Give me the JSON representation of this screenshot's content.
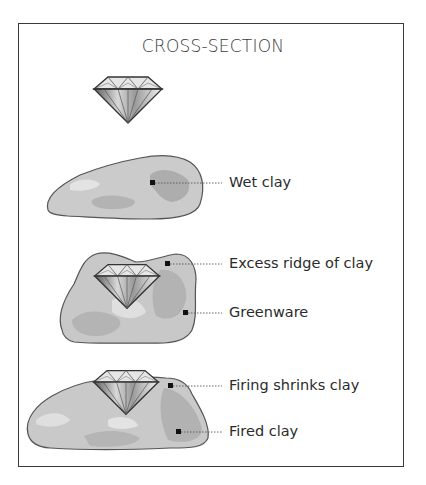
{
  "title": "CROSS-SECTION",
  "stages": [
    {
      "id": "gem",
      "description": "Loose diamond"
    },
    {
      "id": "wet",
      "labels": [
        {
          "text": "Wet clay"
        }
      ]
    },
    {
      "id": "greenware",
      "labels": [
        {
          "text": "Excess ridge of clay"
        },
        {
          "text": "Greenware"
        }
      ]
    },
    {
      "id": "fired",
      "labels": [
        {
          "text": "Firing shrinks clay"
        },
        {
          "text": "Fired clay"
        }
      ]
    }
  ],
  "colors": {
    "frame": "#3a3a3a",
    "clay_fill": "#c9c9c9",
    "clay_dark": "#a9a9a9",
    "clay_light": "#e2e2e2",
    "outline": "#555555",
    "text": "#2b2b2b"
  }
}
